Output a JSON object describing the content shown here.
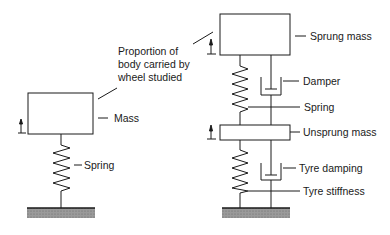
{
  "left_model": {
    "annotation": [
      "Proportion of",
      "body carried by",
      "wheel studied"
    ],
    "mass_label": "Mass",
    "spring_label": "Spring"
  },
  "right_model": {
    "sprung_mass_label": "Sprung mass",
    "damper_label": "Damper",
    "spring_label": "Spring",
    "unsprung_mass_label": "Unsprung mass",
    "tyre_damping_label": "Tyre damping",
    "tyre_stiffness_label": "Tyre stiffness"
  },
  "colors": {
    "line": "#1a1a1a",
    "ground": "#8a8a8a"
  }
}
